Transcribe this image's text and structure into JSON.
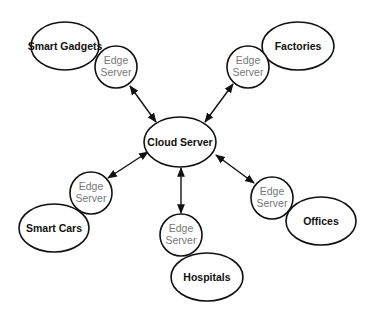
{
  "diagram": {
    "title": "",
    "hub": {
      "label": "Cloud Server"
    },
    "edge_label_line1": "Edge",
    "edge_label_line2": "Server",
    "clusters": [
      {
        "endpoint": "Smart Gadgets",
        "edge": "Edge Server"
      },
      {
        "endpoint": "Factories",
        "edge": "Edge Server"
      },
      {
        "endpoint": "Smart Cars",
        "edge": "Edge Server"
      },
      {
        "endpoint": "Hospitals",
        "edge": "Edge Server"
      },
      {
        "endpoint": "Offices",
        "edge": "Edge Server"
      }
    ],
    "connections": [
      {
        "from": "Cloud Server",
        "to": "Edge Server (Smart Gadgets)",
        "type": "bidirectional"
      },
      {
        "from": "Cloud Server",
        "to": "Edge Server (Factories)",
        "type": "bidirectional"
      },
      {
        "from": "Cloud Server",
        "to": "Edge Server (Smart Cars)",
        "type": "bidirectional"
      },
      {
        "from": "Cloud Server",
        "to": "Edge Server (Hospitals)",
        "type": "bidirectional"
      },
      {
        "from": "Cloud Server",
        "to": "Edge Server (Offices)",
        "type": "bidirectional"
      }
    ]
  }
}
